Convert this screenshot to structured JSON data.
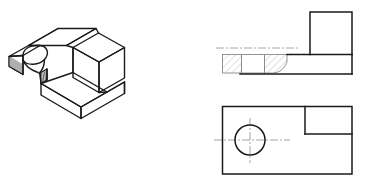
{
  "sheet": {
    "title": "Orthographic and isometric projection of a notched block with counterbored slot",
    "background_color": "#ffffff",
    "width": 367,
    "height": 182
  },
  "styles": {
    "visible_line_color": "#1a1a1a",
    "visible_line_width": 1.4,
    "thin_line_color": "#3a3a3a",
    "thin_line_width": 1.0,
    "hatch_line_color": "#b4b4b4",
    "hatch_line_width": 0.7,
    "center_line_color": "#9a9a9a",
    "center_line_width": 0.8,
    "center_line_dash": "7,2,2,2"
  },
  "views": [
    {
      "id": "isometric-view",
      "name": "Isometric pictorial view",
      "label": "",
      "position": {
        "x": 8,
        "y": 20
      },
      "description": "Rectangular block with upper-left open slot containing a semicircular cutout and a lower step",
      "outline_points": "10,55 30,44 30,55 10,66",
      "geometry": {
        "slot_semicircle_center": {
          "x": 35,
          "y": 58
        },
        "slot_radius": 13
      }
    },
    {
      "id": "front-section-view",
      "name": "Front view in half section",
      "label": "",
      "position": {
        "x": 222,
        "y": 12
      },
      "tall_block": {
        "x": 310,
        "y": 12,
        "width": 42,
        "height": 42
      },
      "base_slab": {
        "x": 222,
        "y": 54,
        "width": 130,
        "height": 20
      },
      "hatch_regions": [
        {
          "x": 223,
          "y": 55,
          "width": 18,
          "height": 18
        },
        {
          "x": 265,
          "y": 55,
          "width": 22,
          "height": 18
        }
      ],
      "center_line_y": 48
    },
    {
      "id": "top-view",
      "name": "Top view",
      "label": "",
      "position": {
        "x": 222,
        "y": 106
      },
      "outline": {
        "x": 222,
        "y": 106,
        "width": 130,
        "height": 68
      },
      "hole": {
        "cx": 250,
        "cy": 140,
        "r": 15
      },
      "notch": {
        "x": 305,
        "y": 106,
        "width": 47,
        "height": 28
      },
      "center_line_y": 140,
      "center_line_x": 250
    }
  ],
  "annotations": {
    "dimensions": [],
    "notes": [],
    "section_label": ""
  }
}
